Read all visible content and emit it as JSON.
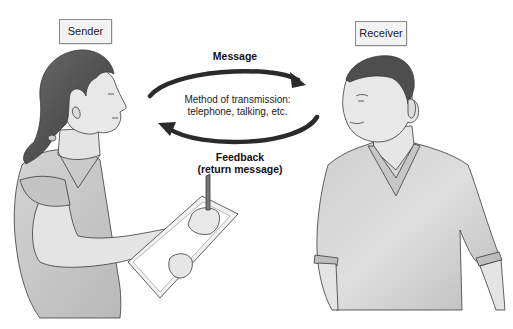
{
  "diagram": {
    "roles": {
      "sender": {
        "label": "Sender"
      },
      "receiver": {
        "label": "Receiver"
      }
    },
    "flows": {
      "message": {
        "label": "Message",
        "direction": "sender-to-receiver"
      },
      "feedback": {
        "line1": "Feedback",
        "line2": "(return message)",
        "direction": "receiver-to-sender"
      }
    },
    "channel": {
      "line1": "Method of transmission:",
      "line2": "telephone, talking, etc."
    },
    "figures": {
      "sender": "woman holding clipboard and pen, facing right",
      "receiver": "man in v-neck t-shirt, facing left"
    },
    "colors": {
      "arrow": "#2a2a2a",
      "shirt": "#c9c9c9",
      "skin": "#e6e6e6",
      "hair": "#4a4a4a",
      "outline": "#3a3a3a",
      "box_border": "#8a8a8a"
    }
  }
}
